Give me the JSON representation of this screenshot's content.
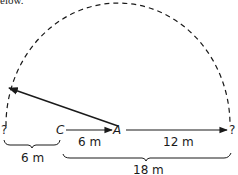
{
  "caption": "elow.",
  "diagram": {
    "points": {
      "left_unknown": "?",
      "c": "C",
      "a": "A",
      "right_unknown": "?"
    },
    "segments": {
      "c_to_a": "6 m",
      "a_to_right": "12 m",
      "left_to_c": "6 m",
      "c_to_right": "18 m"
    },
    "colors": {
      "line": "#1a1a1a",
      "background": "#ffffff"
    }
  }
}
